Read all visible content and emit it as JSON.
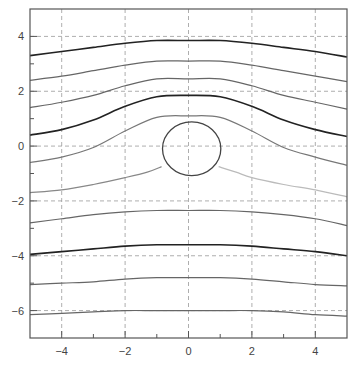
{
  "chart_data": {
    "type": "line",
    "title": "",
    "xlabel": "",
    "ylabel": "",
    "xlim": [
      -5,
      5
    ],
    "ylim": [
      -7,
      5
    ],
    "grid": true,
    "grid_style": "dashed",
    "legend": null,
    "x_ticks": [
      -4,
      -2,
      0,
      2,
      4
    ],
    "x_tick_labels": [
      "−4",
      "−2",
      "0",
      "2",
      "4"
    ],
    "x_minor_ticks": [
      -3,
      -1,
      1,
      3
    ],
    "y_ticks": [
      4,
      2,
      0,
      -2,
      -4,
      -6
    ],
    "y_tick_labels": [
      "4",
      "2",
      "0",
      "−2",
      "−4",
      "−6"
    ],
    "y_minor_ticks": [
      3,
      1,
      -1,
      -3,
      -5
    ],
    "x": [
      -5,
      -4,
      -3,
      -2,
      -1,
      0,
      1,
      2,
      3,
      4,
      5
    ],
    "series": [
      {
        "name": "streamline-1",
        "color": "#222222",
        "width": 1.6,
        "values": [
          3.3,
          3.45,
          3.6,
          3.75,
          3.85,
          3.85,
          3.85,
          3.75,
          3.6,
          3.45,
          3.25
        ]
      },
      {
        "name": "streamline-2",
        "color": "#666666",
        "width": 1.2,
        "values": [
          2.4,
          2.55,
          2.75,
          2.95,
          3.1,
          3.1,
          3.1,
          2.95,
          2.75,
          2.55,
          2.35
        ]
      },
      {
        "name": "streamline-3",
        "color": "#666666",
        "width": 1.2,
        "values": [
          1.4,
          1.6,
          1.85,
          2.2,
          2.45,
          2.45,
          2.45,
          2.2,
          1.85,
          1.6,
          1.35
        ]
      },
      {
        "name": "streamline-4",
        "color": "#222222",
        "width": 1.6,
        "values": [
          0.4,
          0.6,
          0.95,
          1.45,
          1.8,
          1.85,
          1.8,
          1.45,
          0.95,
          0.6,
          0.35
        ]
      },
      {
        "name": "streamline-5",
        "color": "#777777",
        "width": 1.2,
        "values": [
          -0.6,
          -0.4,
          -0.05,
          0.55,
          1.05,
          1.1,
          1.05,
          0.55,
          -0.05,
          -0.4,
          -0.7
        ]
      },
      {
        "name": "streamline-6-left",
        "color": "#888888",
        "width": 1.2,
        "x": [
          -5,
          -4,
          -3,
          -2,
          -1.3,
          -0.85
        ],
        "values": [
          -1.7,
          -1.6,
          -1.4,
          -1.15,
          -0.95,
          -0.75
        ]
      },
      {
        "name": "streamline-6-right",
        "color": "#bbbbbb",
        "width": 1.2,
        "x": [
          0.95,
          1.5,
          2,
          3,
          4,
          5
        ],
        "values": [
          -0.75,
          -0.95,
          -1.15,
          -1.4,
          -1.6,
          -1.85
        ]
      },
      {
        "name": "streamline-7",
        "color": "#666666",
        "width": 1.2,
        "values": [
          -2.8,
          -2.65,
          -2.5,
          -2.4,
          -2.35,
          -2.35,
          -2.35,
          -2.4,
          -2.5,
          -2.65,
          -2.9
        ]
      },
      {
        "name": "streamline-8",
        "color": "#222222",
        "width": 1.6,
        "values": [
          -3.95,
          -3.85,
          -3.75,
          -3.65,
          -3.6,
          -3.6,
          -3.6,
          -3.65,
          -3.75,
          -3.85,
          -4.0
        ]
      },
      {
        "name": "streamline-9",
        "color": "#666666",
        "width": 1.2,
        "values": [
          -5.05,
          -5.0,
          -4.95,
          -4.85,
          -4.8,
          -4.8,
          -4.8,
          -4.85,
          -4.95,
          -5.05,
          -5.1
        ]
      },
      {
        "name": "streamline-10",
        "color": "#666666",
        "width": 1.2,
        "values": [
          -6.15,
          -6.1,
          -6.05,
          -6.0,
          -6.0,
          -6.0,
          -6.0,
          -6.0,
          -6.05,
          -6.15,
          -6.2
        ]
      }
    ],
    "annotations": [
      {
        "type": "circle",
        "name": "cylinder",
        "cx": 0.1,
        "cy": -0.1,
        "rx": 0.92,
        "ry": 0.98,
        "color": "#444444"
      }
    ]
  },
  "style": {
    "frame_color": "#555555",
    "grid_color": "#999999",
    "text_color": "#444444"
  }
}
